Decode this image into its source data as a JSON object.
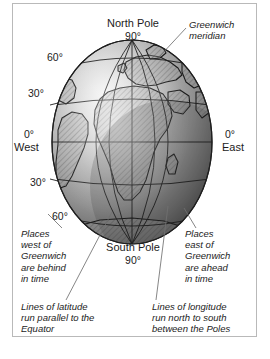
{
  "figure": {
    "kind": "globe-diagram",
    "width": 270,
    "height": 359,
    "frame_color": "#b9b9b9",
    "background_color": "#ffffff",
    "ink_color": "#1c1c1c"
  },
  "globe": {
    "center_x": 132,
    "center_y": 142,
    "radius_x": 80,
    "radius_y": 102,
    "shading": {
      "highlight_color": "#f2f2f2",
      "midtone_color": "#9a9a9a",
      "shadow_color": "#4a4a4a",
      "outline_color": "#2a2a2a"
    },
    "landmass_fill": "hatched",
    "grid": {
      "latitude_lines": [
        "60N",
        "30N",
        "0",
        "30S",
        "60S"
      ],
      "longitude_lines": [
        "60W",
        "30W",
        "0 Greenwich",
        "30E",
        "60E"
      ],
      "line_color": "#1f1f1f"
    }
  },
  "pole_labels": {
    "north": {
      "name": "North Pole",
      "degrees": "90°"
    },
    "south": {
      "name": "South Pole",
      "degrees": "90°"
    }
  },
  "latitude_labels": {
    "north_60": "60°",
    "north_30": "30°",
    "south_30": "30°",
    "south_60": "60°"
  },
  "hemisphere_labels": {
    "west": {
      "degrees": "0°",
      "name": "West"
    },
    "east": {
      "degrees": "0°",
      "name": "East"
    }
  },
  "callouts": {
    "greenwich_meridian": "Greenwich\nmeridian",
    "places_west": "Places\nwest of\nGreenwich\nare behind\nin time",
    "places_east": "Places\neast of\nGreenwich\nare ahead\nin time",
    "lines_of_latitude": "Lines of latitude\nrun parallel to the\nEquator",
    "lines_of_longitude": "Lines of longitude\nrun north to south\nbetween the Poles"
  }
}
